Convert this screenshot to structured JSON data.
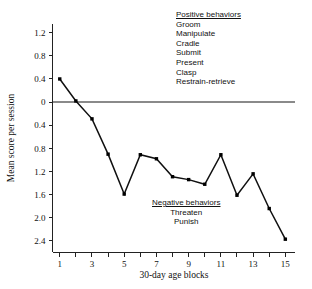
{
  "chart_data": {
    "type": "line",
    "title": "",
    "xlabel": "30-day age blocks",
    "ylabel": "Mean score per session",
    "x": [
      1,
      2,
      3,
      4,
      5,
      6,
      7,
      8,
      9,
      10,
      11,
      12,
      13,
      14,
      15
    ],
    "values": [
      0.4,
      0.02,
      -0.29,
      -0.9,
      -1.59,
      -0.91,
      -0.98,
      -1.29,
      -1.34,
      -1.42,
      -0.91,
      -1.61,
      -1.24,
      -1.84,
      -2.37
    ],
    "series": [
      {
        "name": "Mean score per session",
        "values": [
          0.4,
          0.02,
          -0.29,
          -0.9,
          -1.59,
          -0.91,
          -0.98,
          -1.29,
          -1.34,
          -1.42,
          -0.91,
          -1.61,
          -1.24,
          -1.84,
          -2.37
        ]
      }
    ],
    "xlim": [
      0.55,
      15.6
    ],
    "ylim": [
      -2.6,
      1.35
    ],
    "xticks": [
      1,
      2,
      3,
      4,
      5,
      6,
      7,
      8,
      9,
      10,
      11,
      12,
      13,
      14,
      15
    ],
    "xticklabels": [
      "1",
      "",
      "3",
      "",
      "5",
      "",
      "7",
      "",
      "9",
      "",
      "11",
      "",
      "13",
      "",
      "15"
    ],
    "yticks": [
      1.2,
      0.8,
      0.4,
      0.0,
      -0.4,
      -0.8,
      -1.2,
      -1.6,
      -2.0,
      -2.4
    ],
    "yticklabels": [
      "1.2",
      "0.8",
      "0.4",
      "0",
      "0.4",
      "0.8",
      "1.2",
      "1.6",
      "2.0",
      "2.4"
    ],
    "grid": false,
    "legend_position": "none",
    "zero_reference_line": 0,
    "marker": "square",
    "line_color": "#101010",
    "marker_color": "#000000",
    "zero_line_color": "#8a8a8a"
  },
  "annotations": {
    "positive": {
      "header": "Positive behaviors",
      "items": [
        "Groom",
        "Manipulate",
        "Cradle",
        "Submit",
        "Present",
        "Clasp",
        "Restrain-retrieve"
      ]
    },
    "negative": {
      "header": "Negative behaviors",
      "items": [
        "Threaten",
        "Punish"
      ]
    }
  }
}
